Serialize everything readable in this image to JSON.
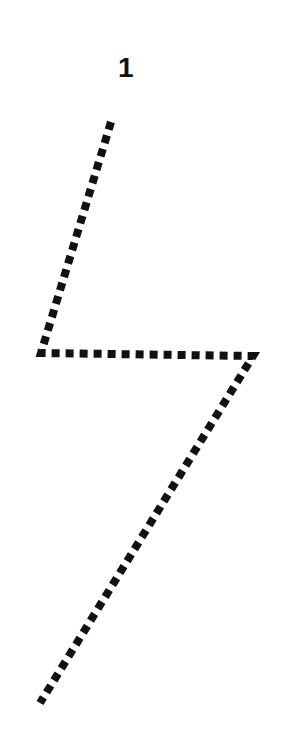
{
  "worksheet": {
    "start_label": "1",
    "stroke_color": "#111111",
    "path_points": [
      [
        111,
        122
      ],
      [
        41,
        353
      ],
      [
        253,
        356
      ],
      [
        40,
        703
      ]
    ]
  }
}
